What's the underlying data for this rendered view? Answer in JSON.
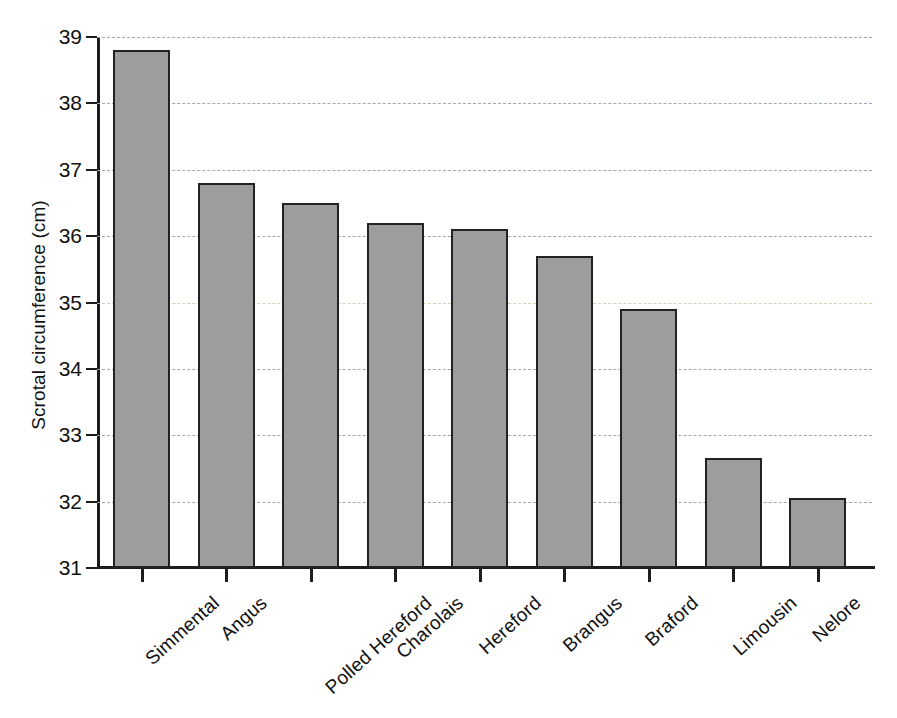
{
  "chart_data": {
    "type": "bar",
    "title": "",
    "xlabel": "",
    "ylabel": "Scrotal circumference (cm)",
    "ylim": [
      31,
      39
    ],
    "ytick_labels": [
      "39",
      "38",
      "37",
      "36",
      "35",
      "34",
      "33",
      "32",
      "31"
    ],
    "yticks": [
      39,
      38,
      37,
      36,
      35,
      34,
      33,
      32,
      31
    ],
    "grid": true,
    "legend": "none",
    "categories": [
      "Simmental",
      "Angus",
      "Polled Hereford",
      "Charolais",
      "Hereford",
      "Brangus",
      "Braford",
      "Limousin",
      "Nelore"
    ],
    "values": [
      38.8,
      36.8,
      36.5,
      36.2,
      36.1,
      35.7,
      34.9,
      32.65,
      32.05
    ],
    "bar_color": "#9d9d9d",
    "bar_edge_color": "#222222",
    "gridline_color": "#9aa4b4",
    "axis_color": "#1d1d1d",
    "background_color": "#ffffff"
  }
}
